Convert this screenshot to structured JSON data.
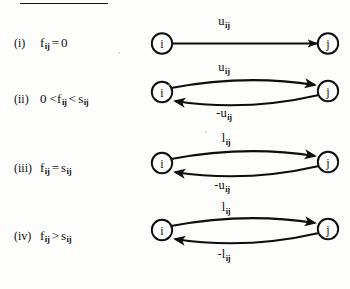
{
  "figure": {
    "heading_fragment": "DEFINITIONS",
    "node_left": "i",
    "node_right": "j"
  },
  "rows": [
    {
      "numeral": "(i)",
      "expr_prefix": "",
      "expr_main": "f",
      "expr_sub": "ij",
      "expr_op": "=",
      "expr_rhs": "0",
      "expr_rhs_sub": "",
      "condition_text": "(i)  f_ij = 0",
      "diagram_type": "single-arc",
      "top_label_text": "u",
      "top_label_sub": "ij",
      "top_label_full": "u_ij",
      "bottom_label_text": "",
      "bottom_label_sub": "",
      "bottom_label_full": ""
    },
    {
      "numeral": "(ii)",
      "expr_prefix": "0 <",
      "expr_main": "f",
      "expr_sub": "ij",
      "expr_op": "<",
      "expr_rhs": "s",
      "expr_rhs_sub": "ij",
      "condition_text": "(ii)  0 < f_ij < s_ij",
      "diagram_type": "double-arc",
      "top_label_text": "u",
      "top_label_sub": "ij",
      "top_label_full": "u_ij",
      "bottom_label_text": "-u",
      "bottom_label_sub": "ij",
      "bottom_label_full": "-u_ij"
    },
    {
      "numeral": "(iii)",
      "expr_prefix": "",
      "expr_main": "f",
      "expr_sub": "ij",
      "expr_op": "=",
      "expr_rhs": "s",
      "expr_rhs_sub": "ij",
      "condition_text": "(iii)  f_ij = s_ij",
      "diagram_type": "double-arc",
      "top_label_text": "l",
      "top_label_sub": "ij",
      "top_label_full": "l_ij",
      "bottom_label_text": "-u",
      "bottom_label_sub": "ij",
      "bottom_label_full": "-u_ij"
    },
    {
      "numeral": "(iv)",
      "expr_prefix": "",
      "expr_main": "f",
      "expr_sub": "ij",
      "expr_op": ">",
      "expr_rhs": "s",
      "expr_rhs_sub": "ij",
      "condition_text": "(iv)  f_ij > s_ij",
      "diagram_type": "double-arc",
      "top_label_text": "l",
      "top_label_sub": "ij",
      "top_label_full": "l_ij",
      "bottom_label_text": "-l",
      "bottom_label_sub": "ij",
      "bottom_label_full": "-l_ij"
    }
  ]
}
